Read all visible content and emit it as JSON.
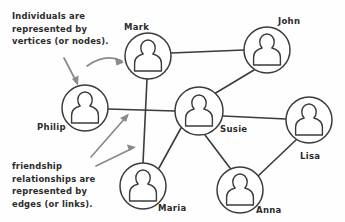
{
  "diagram": {
    "background_color": "#fefefe",
    "stroke_color": "#3b3b3b",
    "annotation_arrow_color": "#8a8a8a"
  },
  "annotations": [
    {
      "id": "vertices-note",
      "lines": [
        "Individuals are",
        "represented by",
        "vertices (or nodes)."
      ],
      "x": 12,
      "y": 10
    },
    {
      "id": "edges-note",
      "lines": [
        "friendship",
        "relationships are",
        "represented by",
        "edges (or links)."
      ],
      "x": 12,
      "y": 160
    }
  ],
  "nodes": [
    {
      "id": "mark",
      "label": "Mark",
      "cx": 148,
      "cy": 56,
      "r": 23,
      "label_x": 124,
      "label_y": 22,
      "icon": "person-icon"
    },
    {
      "id": "john",
      "label": "John",
      "cx": 267,
      "cy": 50,
      "r": 23,
      "label_x": 278,
      "label_y": 16,
      "icon": "person-icon"
    },
    {
      "id": "philip",
      "label": "Philip",
      "cx": 85,
      "cy": 108,
      "r": 23,
      "label_x": 37,
      "label_y": 122,
      "icon": "person-icon"
    },
    {
      "id": "susie",
      "label": "Susie",
      "cx": 199,
      "cy": 111,
      "r": 24,
      "label_x": 220,
      "label_y": 124,
      "icon": "person-icon"
    },
    {
      "id": "lisa",
      "label": "Lisa",
      "cx": 309,
      "cy": 120,
      "r": 23,
      "label_x": 300,
      "label_y": 151,
      "icon": "person-icon"
    },
    {
      "id": "maria",
      "label": "Maria",
      "cx": 143,
      "cy": 186,
      "r": 23,
      "label_x": 158,
      "label_y": 203,
      "icon": "person-icon"
    },
    {
      "id": "anna",
      "label": "Anna",
      "cx": 240,
      "cy": 190,
      "r": 23,
      "label_x": 256,
      "label_y": 205,
      "icon": "person-icon"
    }
  ],
  "edges": [
    {
      "source": "mark",
      "target": "john"
    },
    {
      "source": "mark",
      "target": "maria"
    },
    {
      "source": "philip",
      "target": "susie"
    },
    {
      "source": "john",
      "target": "susie"
    },
    {
      "source": "susie",
      "target": "lisa"
    },
    {
      "source": "susie",
      "target": "maria"
    },
    {
      "source": "susie",
      "target": "anna"
    },
    {
      "source": "anna",
      "target": "lisa"
    }
  ],
  "annotation_arrows": [
    {
      "id": "arrow-to-mark",
      "from_annotation": "vertices-note",
      "to_node": "mark"
    },
    {
      "id": "arrow-to-philip",
      "from_annotation": "vertices-note",
      "to_node": "philip"
    },
    {
      "id": "arrow-to-edge-philip-susie",
      "from_annotation": "edges-note",
      "to_edge": "philip-susie"
    },
    {
      "id": "arrow-to-edge-mark-maria",
      "from_annotation": "edges-note",
      "to_edge": "mark-maria"
    }
  ]
}
